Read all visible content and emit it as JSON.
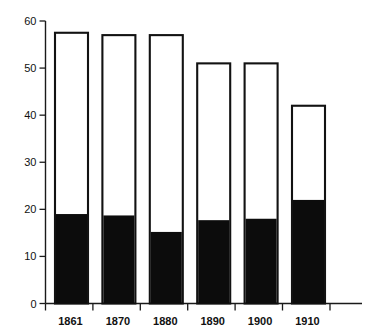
{
  "chart_data": {
    "type": "bar",
    "title": "",
    "subtitle": "",
    "xlabel": "",
    "ylabel": "",
    "categories": [
      "1861",
      "1870",
      "1880",
      "1890",
      "1900",
      "1910"
    ],
    "series": [
      {
        "name": "total",
        "style": "outlined",
        "color": "#ffffff",
        "edge_color": "#121212",
        "values": [
          57.5,
          57,
          57,
          51,
          51,
          42
        ]
      },
      {
        "name": "filled",
        "style": "solid-black",
        "color": "#0c0c0c",
        "edge_color": "#0c0c0c",
        "values": [
          19,
          18.7,
          15.2,
          17.7,
          18,
          22
        ]
      }
    ],
    "ylim": [
      0,
      60
    ],
    "xlim_note": "category axis, axis line extends beyond last bar",
    "yticks": [
      0,
      10,
      20,
      30,
      40,
      50,
      60
    ],
    "ytick_labels": [
      "0",
      "10",
      "20",
      "30",
      "40",
      "50",
      "60"
    ],
    "grid": false,
    "legend": null,
    "legend_position": "none",
    "annotations": [],
    "stacked": true,
    "stack_note": "black segment is drawn from baseline inside each outlined bar"
  },
  "axes": {
    "y_axis_name": "value-axis",
    "x_axis_name": "year-axis"
  },
  "colors": {
    "ink": "#121212",
    "fill_black": "#0c0c0c",
    "bar_white": "#ffffff",
    "background": "#ffffff"
  }
}
